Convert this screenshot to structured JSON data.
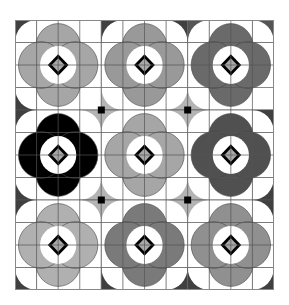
{
  "canvas": {
    "width": 289,
    "height": 305,
    "background": "#ffffff"
  },
  "pattern": {
    "rows": 3,
    "cols": 3,
    "cells_per_tile": 4,
    "grid_line_color": "#555555",
    "ring_color": "#ffffff",
    "diamond_outline_color": "#000000",
    "diamond_fill_color": "#a8a8a8",
    "junction_square_color": "#000000",
    "tiles": [
      {
        "row": 0,
        "col": 0,
        "petal_color": "#a6a6a6",
        "corners": [
          "#404040",
          "#ffffff",
          "#ffffff",
          "#404040"
        ]
      },
      {
        "row": 0,
        "col": 1,
        "petal_color": "#999999",
        "corners": [
          "#404040",
          "#404040",
          "#b4b4b4",
          "#b4b4b4"
        ]
      },
      {
        "row": 0,
        "col": 2,
        "petal_color": "#6a6a6a",
        "corners": [
          "#555555",
          "#555555",
          "#ffffff",
          "#b4b4b4"
        ]
      },
      {
        "row": 1,
        "col": 0,
        "petal_color": "#000000",
        "corners": [
          "#404040",
          "#b4b4b4",
          "#b4b4b4",
          "#404040"
        ]
      },
      {
        "row": 1,
        "col": 1,
        "petal_color": "#a6a6a6",
        "corners": [
          "#b4b4b4",
          "#b4b4b4",
          "#b4b4b4",
          "#b4b4b4"
        ]
      },
      {
        "row": 1,
        "col": 2,
        "petal_color": "#505050",
        "corners": [
          "#b4b4b4",
          "#404040",
          "#404040",
          "#b4b4b4"
        ]
      },
      {
        "row": 2,
        "col": 0,
        "petal_color": "#b0b0b0",
        "corners": [
          "#404040",
          "#b4b4b4",
          "#ffffff",
          "#404040"
        ]
      },
      {
        "row": 2,
        "col": 1,
        "petal_color": "#7a7a7a",
        "corners": [
          "#b4b4b4",
          "#b4b4b4",
          "#404040",
          "#404040"
        ]
      },
      {
        "row": 2,
        "col": 2,
        "petal_color": "#909090",
        "corners": [
          "#b4b4b4",
          "#404040",
          "#404040",
          "#404040"
        ]
      }
    ]
  }
}
